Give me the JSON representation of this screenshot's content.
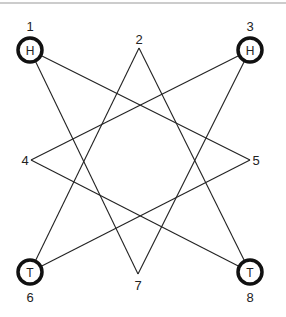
{
  "diagram": {
    "nodes": [
      {
        "id": "1",
        "label": "1",
        "letter": "H",
        "circled": true
      },
      {
        "id": "2",
        "label": "2",
        "letter": "",
        "circled": false
      },
      {
        "id": "3",
        "label": "3",
        "letter": "H",
        "circled": true
      },
      {
        "id": "4",
        "label": "4",
        "letter": "",
        "circled": false
      },
      {
        "id": "5",
        "label": "5",
        "letter": "",
        "circled": false
      },
      {
        "id": "6",
        "label": "6",
        "letter": "T",
        "circled": true
      },
      {
        "id": "7",
        "label": "7",
        "letter": "",
        "circled": false
      },
      {
        "id": "8",
        "label": "8",
        "letter": "T",
        "circled": true
      }
    ],
    "edges": [
      [
        "1",
        "5"
      ],
      [
        "1",
        "7"
      ],
      [
        "3",
        "4"
      ],
      [
        "3",
        "7"
      ],
      [
        "2",
        "6"
      ],
      [
        "2",
        "8"
      ],
      [
        "4",
        "8"
      ],
      [
        "5",
        "6"
      ]
    ]
  }
}
